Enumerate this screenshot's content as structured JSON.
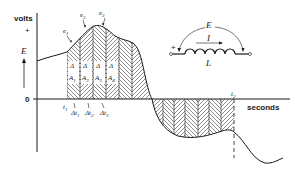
{
  "axes": {
    "y_label": "volts",
    "y_plus": "+",
    "y_quantity": "E",
    "zero_label": "0",
    "x_label": "seconds"
  },
  "time_marks": {
    "t1": "t",
    "t1_sub": "1",
    "t2": "t",
    "t2_sub": "2",
    "delta_t": [
      {
        "label": "Δt",
        "sub": "1"
      },
      {
        "label": "Δt",
        "sub": "2"
      },
      {
        "label": "Δt",
        "sub": "3"
      }
    ]
  },
  "emf_points": [
    {
      "label": "e",
      "sub": "1"
    },
    {
      "label": "e",
      "sub": "2"
    },
    {
      "label": "e",
      "sub": "3"
    }
  ],
  "areas": [
    {
      "delta": "Δ",
      "label": "A",
      "sub": "1"
    },
    {
      "delta": "Δ",
      "label": "A",
      "sub": "2"
    },
    {
      "delta": "Δ",
      "label": "A",
      "sub": "3"
    },
    {
      "delta": "Δ",
      "label": "A",
      "sub": "4"
    }
  ],
  "inductor": {
    "voltage_label": "E",
    "current_label": "I",
    "inductance_label": "L",
    "polarity": "+"
  },
  "colors": {
    "ink": "#1a1a1a",
    "background": "#ffffff"
  }
}
